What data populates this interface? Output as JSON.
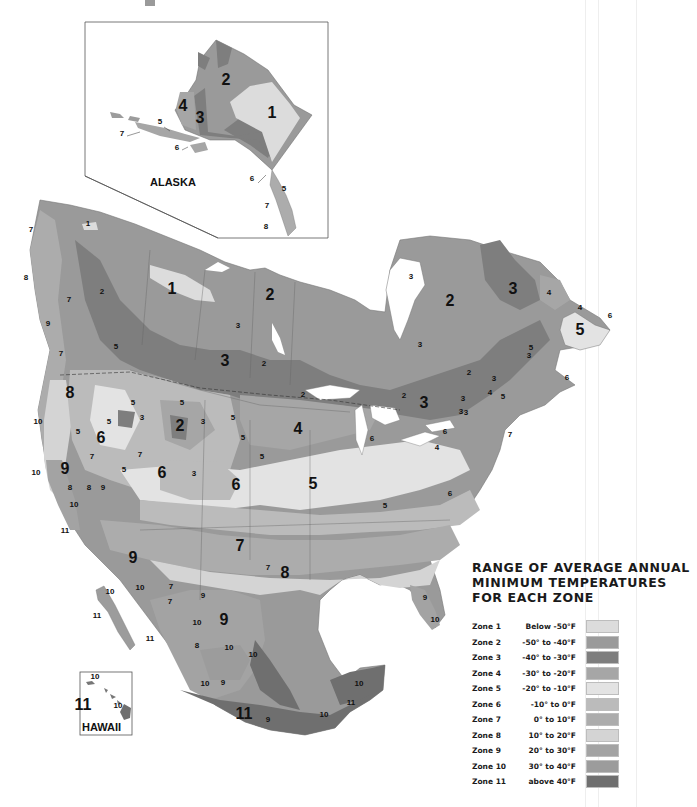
{
  "map": {
    "title": "Plant Hardiness Zone Map of North America",
    "insets": {
      "alaska": {
        "label": "ALASKA"
      },
      "hawaii": {
        "label": "HAWAII"
      }
    },
    "zone_colors": {
      "1": "#dcdcdc",
      "2": "#9a9a9a",
      "3": "#7e7e7e",
      "4": "#a6a6a6",
      "5": "#e3e3e3",
      "6": "#bbbbbb",
      "7": "#acacac",
      "8": "#d4d4d4",
      "9": "#a3a3a3",
      "10": "#9c9c9c",
      "11": "#6f6f6f"
    },
    "labels": {
      "alaska": [
        {
          "t": "2",
          "x": 226,
          "y": 85,
          "s": "lg"
        },
        {
          "t": "1",
          "x": 272,
          "y": 118,
          "s": "lg"
        },
        {
          "t": "4",
          "x": 183,
          "y": 111,
          "s": "lg"
        },
        {
          "t": "3",
          "x": 200,
          "y": 123,
          "s": "lg"
        },
        {
          "t": "5",
          "x": 160,
          "y": 124,
          "s": "sm"
        },
        {
          "t": "7",
          "x": 122,
          "y": 136,
          "s": "sm"
        },
        {
          "t": "6",
          "x": 177,
          "y": 150,
          "s": "sm"
        },
        {
          "t": "6",
          "x": 252,
          "y": 181,
          "s": "sm"
        },
        {
          "t": "5",
          "x": 284,
          "y": 191,
          "s": "sm"
        },
        {
          "t": "7",
          "x": 267,
          "y": 208,
          "s": "sm"
        },
        {
          "t": "8",
          "x": 266,
          "y": 229,
          "s": "sm"
        }
      ],
      "mainland": [
        {
          "t": "1",
          "x": 88,
          "y": 226,
          "s": "sm"
        },
        {
          "t": "7",
          "x": 31,
          "y": 232,
          "s": "sm"
        },
        {
          "t": "8",
          "x": 26,
          "y": 280,
          "s": "sm"
        },
        {
          "t": "2",
          "x": 102,
          "y": 294,
          "s": "sm"
        },
        {
          "t": "7",
          "x": 69,
          "y": 302,
          "s": "sm"
        },
        {
          "t": "9",
          "x": 48,
          "y": 326,
          "s": "sm"
        },
        {
          "t": "7",
          "x": 61,
          "y": 356,
          "s": "sm"
        },
        {
          "t": "5",
          "x": 116,
          "y": 349,
          "s": "sm"
        },
        {
          "t": "8",
          "x": 70,
          "y": 398,
          "s": "lg"
        },
        {
          "t": "1",
          "x": 172,
          "y": 294,
          "s": "lg"
        },
        {
          "t": "2",
          "x": 270,
          "y": 300,
          "s": "lg"
        },
        {
          "t": "3",
          "x": 238,
          "y": 328,
          "s": "sm"
        },
        {
          "t": "3",
          "x": 225,
          "y": 366,
          "s": "lg"
        },
        {
          "t": "2",
          "x": 264,
          "y": 366,
          "s": "sm"
        },
        {
          "t": "2",
          "x": 303,
          "y": 397,
          "s": "sm"
        },
        {
          "t": "3",
          "x": 411,
          "y": 279,
          "s": "sm"
        },
        {
          "t": "2",
          "x": 450,
          "y": 306,
          "s": "lg"
        },
        {
          "t": "3",
          "x": 420,
          "y": 347,
          "s": "sm"
        },
        {
          "t": "3",
          "x": 513,
          "y": 294,
          "s": "lg"
        },
        {
          "t": "4",
          "x": 549,
          "y": 295,
          "s": "sm"
        },
        {
          "t": "4",
          "x": 580,
          "y": 310,
          "s": "sm"
        },
        {
          "t": "6",
          "x": 610,
          "y": 318,
          "s": "sm"
        },
        {
          "t": "5",
          "x": 580,
          "y": 335,
          "s": "lg"
        },
        {
          "t": "5",
          "x": 531,
          "y": 350,
          "s": "sm"
        },
        {
          "t": "3",
          "x": 529,
          "y": 358,
          "s": "sm"
        },
        {
          "t": "6",
          "x": 567,
          "y": 380,
          "s": "sm"
        },
        {
          "t": "2",
          "x": 469,
          "y": 375,
          "s": "sm"
        },
        {
          "t": "3",
          "x": 494,
          "y": 381,
          "s": "sm"
        },
        {
          "t": "4",
          "x": 490,
          "y": 395,
          "s": "sm"
        },
        {
          "t": "5",
          "x": 503,
          "y": 399,
          "s": "sm"
        },
        {
          "t": "3",
          "x": 463,
          "y": 401,
          "s": "sm"
        },
        {
          "t": "3",
          "x": 461,
          "y": 414,
          "s": "sm"
        },
        {
          "t": "2",
          "x": 404,
          "y": 398,
          "s": "sm"
        },
        {
          "t": "3",
          "x": 424,
          "y": 408,
          "s": "lg"
        },
        {
          "t": "3",
          "x": 466,
          "y": 415,
          "s": "sm"
        },
        {
          "t": "6",
          "x": 445,
          "y": 434,
          "s": "sm"
        },
        {
          "t": "7",
          "x": 510,
          "y": 437,
          "s": "sm"
        },
        {
          "t": "4",
          "x": 437,
          "y": 450,
          "s": "sm"
        },
        {
          "t": "10",
          "x": 38,
          "y": 424,
          "s": "sm"
        },
        {
          "t": "5",
          "x": 78,
          "y": 434,
          "s": "sm"
        },
        {
          "t": "5",
          "x": 109,
          "y": 424,
          "s": "sm"
        },
        {
          "t": "5",
          "x": 133,
          "y": 405,
          "s": "sm"
        },
        {
          "t": "3",
          "x": 142,
          "y": 420,
          "s": "sm"
        },
        {
          "t": "5",
          "x": 182,
          "y": 405,
          "s": "sm"
        },
        {
          "t": "2",
          "x": 180,
          "y": 431,
          "s": "lg"
        },
        {
          "t": "3",
          "x": 203,
          "y": 424,
          "s": "sm"
        },
        {
          "t": "5",
          "x": 233,
          "y": 420,
          "s": "sm"
        },
        {
          "t": "5",
          "x": 243,
          "y": 440,
          "s": "sm"
        },
        {
          "t": "5",
          "x": 262,
          "y": 459,
          "s": "sm"
        },
        {
          "t": "4",
          "x": 298,
          "y": 434,
          "s": "lg"
        },
        {
          "t": "6",
          "x": 101,
          "y": 443,
          "s": "lg"
        },
        {
          "t": "7",
          "x": 92,
          "y": 459,
          "s": "sm"
        },
        {
          "t": "7",
          "x": 140,
          "y": 457,
          "s": "sm"
        },
        {
          "t": "5",
          "x": 124,
          "y": 472,
          "s": "sm"
        },
        {
          "t": "6",
          "x": 162,
          "y": 478,
          "s": "lg"
        },
        {
          "t": "3",
          "x": 194,
          "y": 476,
          "s": "sm"
        },
        {
          "t": "6",
          "x": 236,
          "y": 490,
          "s": "lg"
        },
        {
          "t": "6",
          "x": 372,
          "y": 441,
          "s": "sm"
        },
        {
          "t": "10",
          "x": 36,
          "y": 475,
          "s": "sm"
        },
        {
          "t": "9",
          "x": 65,
          "y": 474,
          "s": "lg"
        },
        {
          "t": "8",
          "x": 70,
          "y": 490,
          "s": "sm"
        },
        {
          "t": "8",
          "x": 89,
          "y": 490,
          "s": "sm"
        },
        {
          "t": "9",
          "x": 103,
          "y": 490,
          "s": "sm"
        },
        {
          "t": "10",
          "x": 74,
          "y": 507,
          "s": "sm"
        },
        {
          "t": "11",
          "x": 65,
          "y": 533,
          "s": "sm"
        },
        {
          "t": "5",
          "x": 313,
          "y": 489,
          "s": "lg"
        },
        {
          "t": "5",
          "x": 385,
          "y": 508,
          "s": "sm"
        },
        {
          "t": "6",
          "x": 450,
          "y": 496,
          "s": "sm"
        },
        {
          "t": "7",
          "x": 240,
          "y": 551,
          "s": "lg"
        },
        {
          "t": "7",
          "x": 268,
          "y": 570,
          "s": "sm"
        },
        {
          "t": "8",
          "x": 285,
          "y": 578,
          "s": "lg"
        },
        {
          "t": "9",
          "x": 133,
          "y": 563,
          "s": "lg"
        },
        {
          "t": "10",
          "x": 140,
          "y": 590,
          "s": "sm"
        },
        {
          "t": "7",
          "x": 171,
          "y": 589,
          "s": "sm"
        },
        {
          "t": "7",
          "x": 170,
          "y": 604,
          "s": "sm"
        },
        {
          "t": "9",
          "x": 203,
          "y": 598,
          "s": "sm"
        },
        {
          "t": "10",
          "x": 110,
          "y": 594,
          "s": "sm"
        },
        {
          "t": "11",
          "x": 97,
          "y": 618,
          "s": "sm"
        },
        {
          "t": "11",
          "x": 150,
          "y": 641,
          "s": "sm"
        },
        {
          "t": "10",
          "x": 197,
          "y": 625,
          "s": "sm"
        },
        {
          "t": "9",
          "x": 224,
          "y": 625,
          "s": "lg"
        },
        {
          "t": "8",
          "x": 197,
          "y": 648,
          "s": "sm"
        },
        {
          "t": "10",
          "x": 229,
          "y": 650,
          "s": "sm"
        },
        {
          "t": "10",
          "x": 253,
          "y": 657,
          "s": "sm"
        },
        {
          "t": "10",
          "x": 205,
          "y": 686,
          "s": "sm"
        },
        {
          "t": "9",
          "x": 223,
          "y": 685,
          "s": "sm"
        },
        {
          "t": "11",
          "x": 244,
          "y": 719,
          "s": "lg"
        },
        {
          "t": "9",
          "x": 268,
          "y": 722,
          "s": "sm"
        },
        {
          "t": "10",
          "x": 324,
          "y": 717,
          "s": "sm"
        },
        {
          "t": "11",
          "x": 351,
          "y": 705,
          "s": "sm"
        },
        {
          "t": "10",
          "x": 359,
          "y": 686,
          "s": "sm"
        },
        {
          "t": "9",
          "x": 425,
          "y": 600,
          "s": "sm"
        },
        {
          "t": "10",
          "x": 435,
          "y": 622,
          "s": "sm"
        }
      ],
      "hawaii": [
        {
          "t": "10",
          "x": 95,
          "y": 679,
          "s": "sm"
        },
        {
          "t": "11",
          "x": 83,
          "y": 710,
          "s": "lg"
        },
        {
          "t": "10",
          "x": 118,
          "y": 708,
          "s": "sm"
        }
      ]
    }
  },
  "legend": {
    "title": "RANGE OF AVERAGE ANNUAL\nMINIMUM TEMPERATURES\nFOR EACH ZONE",
    "rows": [
      {
        "zone": "Zone 1",
        "range": "Below -50°F",
        "color": "#dcdcdc"
      },
      {
        "zone": "Zone 2",
        "range": "-50° to -40°F",
        "color": "#9a9a9a"
      },
      {
        "zone": "Zone 3",
        "range": "-40° to -30°F",
        "color": "#7e7e7e"
      },
      {
        "zone": "Zone 4",
        "range": "-30° to -20°F",
        "color": "#a6a6a6"
      },
      {
        "zone": "Zone 5",
        "range": "-20° to -10°F",
        "color": "#e3e3e3"
      },
      {
        "zone": "Zone 6",
        "range": "-10° to 0°F",
        "color": "#bbbbbb"
      },
      {
        "zone": "Zone 7",
        "range": "0° to 10°F",
        "color": "#acacac"
      },
      {
        "zone": "Zone 8",
        "range": "10° to 20°F",
        "color": "#d4d4d4"
      },
      {
        "zone": "Zone 9",
        "range": "20° to 30°F",
        "color": "#a3a3a3"
      },
      {
        "zone": "Zone 10",
        "range": "30° to 40°F",
        "color": "#9c9c9c"
      },
      {
        "zone": "Zone 11",
        "range": "above 40°F",
        "color": "#6f6f6f"
      }
    ]
  }
}
